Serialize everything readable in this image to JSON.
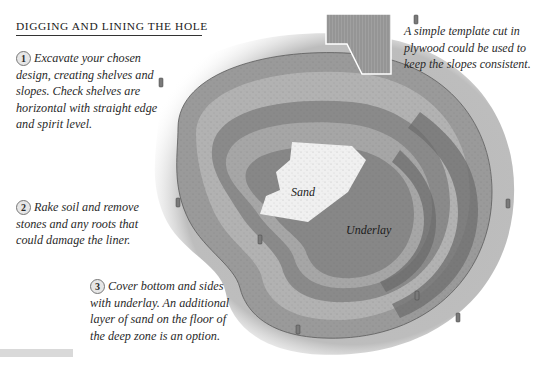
{
  "heading": "DIGGING AND LINING THE HOLE",
  "steps": [
    {
      "number": "1",
      "text": "Excavate your chosen design, creating shelves and slopes. Check shelves are horizontal with straight edge and spirit level."
    },
    {
      "number": "2",
      "text": "Rake soil and remove stones and any roots that could damage the liner."
    },
    {
      "number": "3",
      "text": "Cover bottom and sides with underlay. An additional layer of sand on the floor of the deep zone is an option."
    }
  ],
  "template_caption": "A simple template cut in plywood could be used to keep the slopes consistent.",
  "illustration": {
    "labels": {
      "sand": "Sand",
      "underlay": "Underlay"
    },
    "colors": {
      "soil": "#b5b5b5",
      "rim": "#8f8f8f",
      "shelf": "#a9a9a9",
      "shelf_dark": "#777777",
      "sand": "#f1f1f1",
      "underlay": "#8a8a8a",
      "underlay_dark": "#6a6a6a",
      "template": "#9c9c9c"
    }
  }
}
